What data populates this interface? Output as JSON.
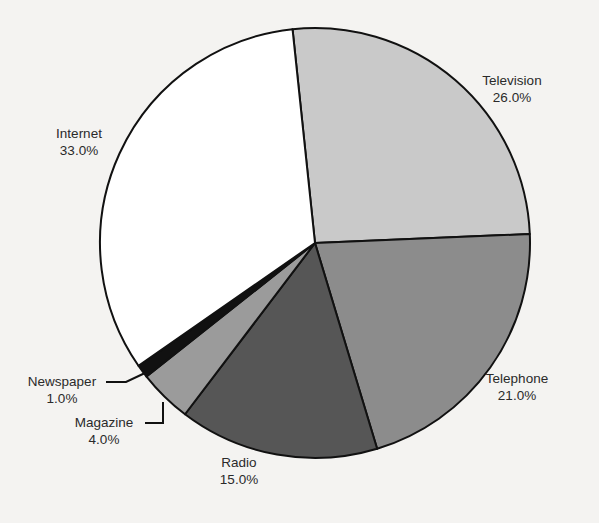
{
  "chart_data": {
    "type": "pie",
    "title": "",
    "start_angle_deg": -6,
    "direction": "clockwise",
    "center": [
      315,
      243
    ],
    "radius": 215,
    "categories": [
      "Television",
      "Telephone",
      "Radio",
      "Magazine",
      "Newspaper",
      "Internet"
    ],
    "values": [
      26.0,
      21.0,
      15.0,
      4.0,
      1.0,
      33.0
    ],
    "value_labels": [
      "26.0%",
      "21.0%",
      "15.0%",
      "4.0%",
      "1.0%",
      "33.0%"
    ],
    "colors": [
      "#c9c9c9",
      "#8c8c8c",
      "#565656",
      "#9b9b9b",
      "#111111",
      "#ffffff"
    ],
    "labels": [
      {
        "name": "Television",
        "pct": "26.0%",
        "x": 512,
        "y": 85,
        "anchor": "middle"
      },
      {
        "name": "Telephone",
        "pct": "21.0%",
        "x": 517,
        "y": 383,
        "anchor": "middle"
      },
      {
        "name": "Radio",
        "pct": "15.0%",
        "x": 239,
        "y": 467,
        "anchor": "middle"
      },
      {
        "name": "Magazine",
        "pct": "4.0%",
        "x": 104,
        "y": 427,
        "anchor": "middle"
      },
      {
        "name": "Newspaper",
        "pct": "1.0%",
        "x": 62,
        "y": 386,
        "anchor": "middle"
      },
      {
        "name": "Internet",
        "pct": "33.0%",
        "x": 79,
        "y": 138,
        "anchor": "middle"
      }
    ],
    "leader_lines": [
      {
        "for": "Newspaper",
        "points": [
          [
            106,
            382
          ],
          [
            126,
            382
          ],
          [
            145,
            373
          ]
        ]
      },
      {
        "for": "Magazine",
        "points": [
          [
            145,
            423
          ],
          [
            163,
            423
          ],
          [
            163,
            402
          ]
        ]
      }
    ],
    "legend": "none (direct labels)",
    "grid": false
  }
}
